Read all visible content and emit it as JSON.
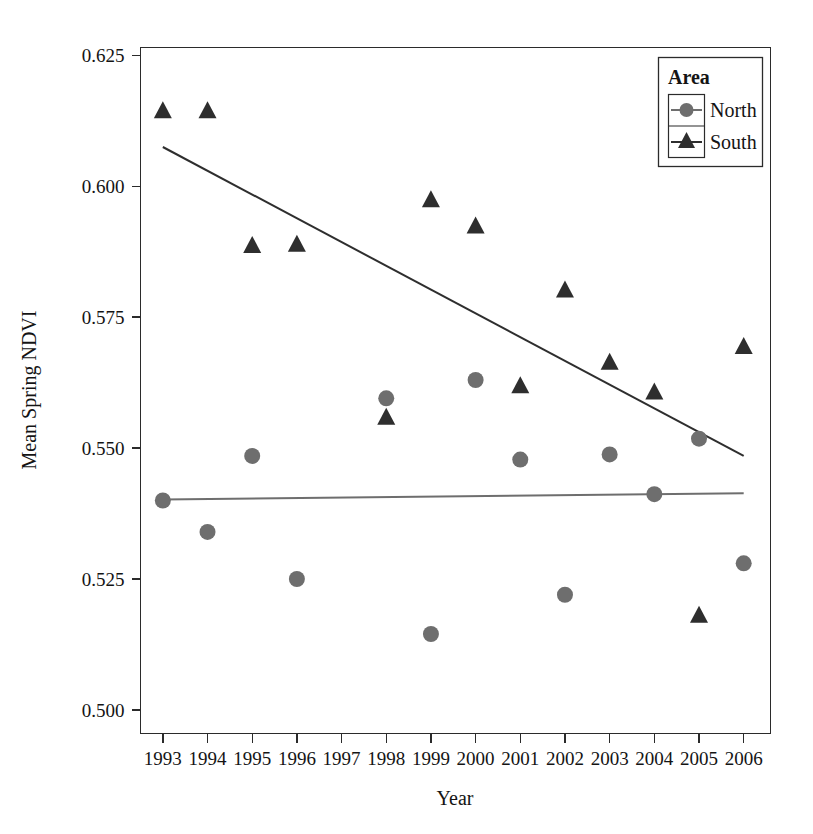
{
  "chart_data": {
    "type": "scatter",
    "title": "",
    "xlabel": "Year",
    "ylabel": "Mean Spring NDVI",
    "x": [
      1993,
      1994,
      1995,
      1996,
      1997,
      1998,
      1999,
      2000,
      2001,
      2002,
      2003,
      2004,
      2005,
      2006
    ],
    "xtick_labels": [
      "1993",
      "1994",
      "1995",
      "1996",
      "1997",
      "1998",
      "1999",
      "2000",
      "2001",
      "2002",
      "2003",
      "2004",
      "2005",
      "2006"
    ],
    "ytick_labels": [
      "0.500",
      "0.525",
      "0.550",
      "0.575",
      "0.600",
      "0.625"
    ],
    "ytick_values": [
      0.5,
      0.525,
      0.55,
      0.575,
      0.6,
      0.625
    ],
    "xlim": [
      1992.5,
      2006.6
    ],
    "ylim": [
      0.4955,
      0.6265
    ],
    "grid": false,
    "legend_position": "top-right",
    "legend_title": "Area",
    "series": [
      {
        "name": "North",
        "marker": "circle",
        "color": "#6e6e6e",
        "x": [
          1993,
          1994,
          1995,
          1996,
          1998,
          1999,
          2000,
          2001,
          2002,
          2003,
          2004,
          2005,
          2006
        ],
        "values": [
          0.54,
          0.534,
          0.5485,
          0.525,
          0.5595,
          0.5145,
          0.563,
          0.5478,
          0.522,
          0.5488,
          0.5412,
          0.5518,
          0.528
        ],
        "trend": {
          "x0": 1993,
          "y0": 0.5402,
          "x1": 2006,
          "y1": 0.5414
        }
      },
      {
        "name": "South",
        "marker": "triangle",
        "color": "#2e2e2e",
        "x": [
          1993,
          1994,
          1995,
          1996,
          1998,
          1999,
          2000,
          2001,
          2002,
          2003,
          2004,
          2005,
          2006
        ],
        "values": [
          0.6145,
          0.6145,
          0.5888,
          0.589,
          0.556,
          0.5975,
          0.5925,
          0.562,
          0.5803,
          0.5665,
          0.5608,
          0.5182,
          0.5695
        ],
        "trend": {
          "x0": 1993,
          "y0": 0.6075,
          "x1": 2006,
          "y1": 0.5485
        }
      }
    ]
  },
  "legend": {
    "title": "Area",
    "entries": [
      {
        "label": "North",
        "marker": "circle",
        "color": "#6e6e6e"
      },
      {
        "label": "South",
        "marker": "triangle",
        "color": "#2e2e2e"
      }
    ]
  },
  "axes": {
    "x_title": "Year",
    "y_title": "Mean Spring NDVI"
  }
}
